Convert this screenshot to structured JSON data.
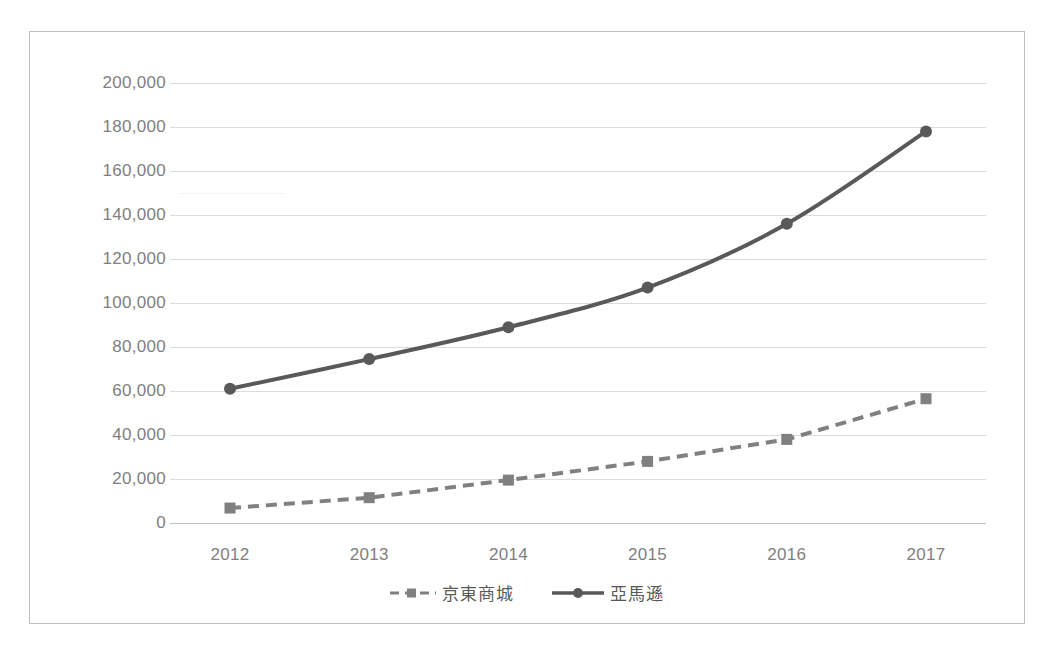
{
  "chart_data": {
    "type": "line",
    "title": "",
    "subtitle": "",
    "xlabel": "",
    "ylabel": "",
    "categories": [
      "2012",
      "2013",
      "2014",
      "2015",
      "2016",
      "2017"
    ],
    "ylim": [
      0,
      200000
    ],
    "y_ticks": [
      0,
      20000,
      40000,
      60000,
      80000,
      100000,
      120000,
      140000,
      160000,
      180000,
      200000
    ],
    "y_tick_labels": [
      "0",
      "20,000",
      "40,000",
      "60,000",
      "80,000",
      "100,000",
      "120,000",
      "140,000",
      "160,000",
      "180,000",
      "200,000"
    ],
    "grid": true,
    "legend_position": "bottom",
    "series": [
      {
        "name": "京東商城",
        "values": [
          6800,
          11500,
          19500,
          28000,
          38000,
          56500
        ],
        "color": "#808080",
        "line_style": "dashed",
        "marker": "square"
      },
      {
        "name": "亞馬遜",
        "values": [
          61000,
          74500,
          89000,
          107000,
          136000,
          178000
        ],
        "color": "#595959",
        "line_style": "solid",
        "marker": "circle"
      }
    ]
  },
  "legend": {
    "items": [
      {
        "label": "京東商城",
        "marker": "square-dashed-line-swatch"
      },
      {
        "label": "亞馬遜",
        "marker": "circle-solid-line-swatch"
      }
    ]
  },
  "colors": {
    "series_jd": "#808080",
    "series_amazon": "#595959",
    "gridline": "#dcdcdc",
    "axis": "#bfbfbf",
    "tick_text": "#808080",
    "legend_text": "#595959",
    "frame_border": "#bfbfbf",
    "background": "#ffffff"
  }
}
